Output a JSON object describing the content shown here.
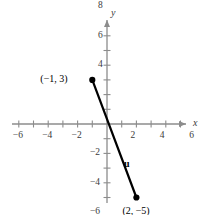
{
  "figure": {
    "title": "",
    "background_color": "#ffffff",
    "axis_color": "#8c8c8c",
    "curve_color": "#000000"
  },
  "chart_data": {
    "type": "scatter",
    "title": "",
    "xlabel": "x",
    "ylabel": "y",
    "xlim": [
      -9.2,
      7.4
    ],
    "ylim": [
      -7.2,
      9.6
    ],
    "grid": false,
    "legend": null,
    "x_tick_labels": [
      "-8",
      "-6",
      "-4",
      "-2",
      "2",
      "4",
      "6"
    ],
    "x_tick_values": [
      -8,
      -6,
      -4,
      -2,
      2,
      4,
      6
    ],
    "y_tick_labels": [
      "8",
      "6",
      "4",
      "-2",
      "-4",
      "-6"
    ],
    "y_tick_values": [
      8,
      6,
      4,
      -2,
      -4,
      -6
    ],
    "minor_tick_step": 1,
    "points": [
      {
        "name": "point-a",
        "x": -1,
        "y": 3,
        "label": "(−1, 3)",
        "label_side": "left"
      },
      {
        "name": "point-b",
        "x": 2,
        "y": -5,
        "label": "(2, −5)",
        "label_side": "below-right"
      }
    ],
    "segments": [
      {
        "name": "vector-u",
        "label": "u",
        "from": {
          "x": -1,
          "y": 3
        },
        "to": {
          "x": 2,
          "y": -5
        },
        "color": "#000000",
        "width": 2.2
      }
    ],
    "annotations": [
      {
        "name": "vector-label-u",
        "text": "u",
        "x": 1.15,
        "y": -2.4
      }
    ]
  },
  "axes": {
    "x_axis_name": "x",
    "y_axis_name": "y"
  }
}
